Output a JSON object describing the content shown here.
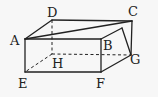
{
  "figure": {
    "type": "rectangular-prism",
    "stroke_color": "#222222",
    "background": "#f7f7f7",
    "vertices": {
      "A": {
        "label": "A",
        "x": 25,
        "y": 39,
        "lx": 10,
        "ly": 45
      },
      "B": {
        "label": "B",
        "x": 101,
        "y": 39,
        "lx": 103,
        "ly": 50
      },
      "C": {
        "label": "C",
        "x": 132,
        "y": 21,
        "lx": 128,
        "ly": 16
      },
      "D": {
        "label": "D",
        "x": 52,
        "y": 20,
        "lx": 47,
        "ly": 17
      },
      "E": {
        "label": "E",
        "x": 25,
        "y": 72,
        "lx": 18,
        "ly": 88
      },
      "F": {
        "label": "F",
        "x": 101,
        "y": 72,
        "lx": 96,
        "ly": 88
      },
      "G": {
        "label": "G",
        "x": 131,
        "y": 55,
        "lx": 130,
        "ly": 64
      },
      "H": {
        "label": "H",
        "x": 52,
        "y": 54,
        "lx": 52,
        "ly": 68
      }
    },
    "solid_edges": [
      [
        "A",
        "B"
      ],
      [
        "A",
        "D"
      ],
      [
        "D",
        "C"
      ],
      [
        "A",
        "C"
      ],
      [
        "B",
        "P"
      ],
      [
        "P",
        "G"
      ],
      [
        "C",
        "G"
      ],
      [
        "A",
        "E"
      ],
      [
        "E",
        "F"
      ],
      [
        "B",
        "F"
      ],
      [
        "F",
        "G"
      ]
    ],
    "dashed_edges": [
      [
        "D",
        "H"
      ],
      [
        "H",
        "E"
      ],
      [
        "H",
        "G"
      ]
    ],
    "aux_points": {
      "P": {
        "x": 122,
        "y": 28
      }
    }
  }
}
